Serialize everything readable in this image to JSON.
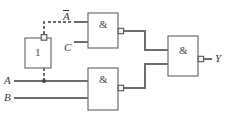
{
  "diagram": {
    "type": "logic-circuit-schematic",
    "background": "#ffffff",
    "line_color": "#6e6e6e",
    "text_color": "#3c3c3c"
  },
  "labels": {
    "input_a": "A",
    "input_b": "B",
    "input_c": "C",
    "a_not_base": "A",
    "a_not_display": "Ā",
    "output_y": "Y"
  },
  "blocks": {
    "inverter": {
      "symbol": "1",
      "name": "inverter-block",
      "x": 25,
      "y": 38,
      "width": 26,
      "height": 30,
      "orientation": "vertical",
      "output_bubble": "top"
    },
    "nand_top": {
      "symbol": "&",
      "name": "nand-gate-top",
      "x": 88,
      "y": 13,
      "width": 30,
      "height": 35,
      "inputs": [
        "Ā",
        "C"
      ],
      "output_bubble": "right"
    },
    "nand_bottom": {
      "symbol": "&",
      "name": "nand-gate-bottom",
      "x": 88,
      "y": 68,
      "width": 30,
      "height": 42,
      "inputs": [
        "A",
        "B"
      ],
      "output_bubble": "right"
    },
    "nand_output": {
      "symbol": "&",
      "name": "nand-gate-output",
      "x": 168,
      "y": 36,
      "width": 30,
      "height": 40,
      "output_bubble": "right",
      "output_label": "Y"
    }
  },
  "wires": {
    "a_bus_y": 81,
    "b_bus_y": 98,
    "c_line_y": 42,
    "a_not_line_y": 22,
    "junction_x": 44,
    "dashed_segments": "inverter-output-to-nand-top-input"
  }
}
